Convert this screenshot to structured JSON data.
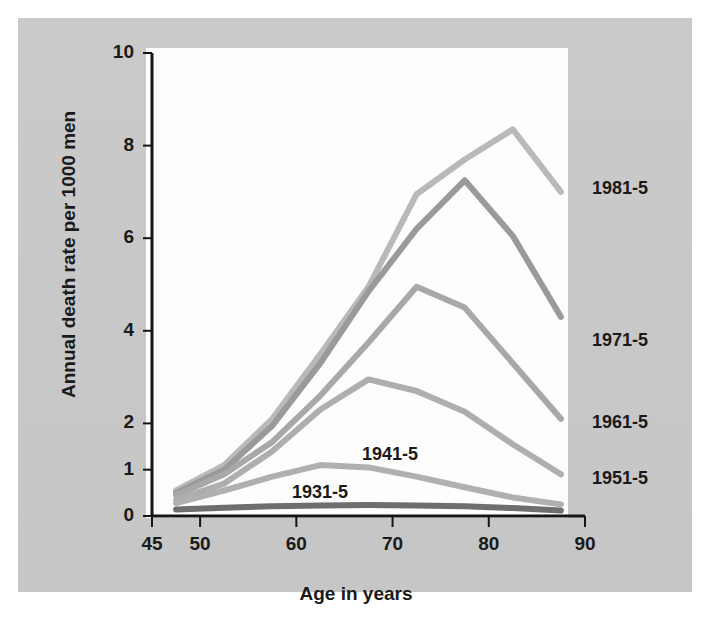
{
  "chart_data": {
    "type": "line",
    "title": "",
    "xlabel": "Age in years",
    "ylabel": "Annual death rate per 1000 men",
    "xlim": [
      45,
      90
    ],
    "ylim": [
      0,
      10
    ],
    "xticks": [
      45,
      50,
      60,
      70,
      80,
      90
    ],
    "xticklabels": [
      "45",
      "50",
      "60",
      "70",
      "80",
      "90"
    ],
    "yticks": [
      0,
      1,
      2,
      4,
      6,
      8,
      10
    ],
    "yticklabels": [
      "0",
      "1",
      "2",
      "4",
      "6",
      "8",
      "10"
    ],
    "grid": false,
    "legend_position": "inline-right",
    "x": [
      47.5,
      52.5,
      57.5,
      62.5,
      67.5,
      72.5,
      77.5,
      82.5,
      87.5
    ],
    "series": [
      {
        "name": "1981-5",
        "color": "#b9b9b9",
        "label_x": 592,
        "label_y": 178,
        "label_inline": false,
        "values": [
          0.55,
          1.1,
          2.1,
          3.5,
          4.95,
          6.95,
          7.7,
          8.35,
          7.0
        ]
      },
      {
        "name": "1971-5",
        "color": "#9a9a9a",
        "label_x": 592,
        "label_y": 330,
        "label_inline": false,
        "values": [
          0.5,
          1.0,
          1.95,
          3.3,
          4.85,
          6.2,
          7.25,
          6.05,
          4.3
        ]
      },
      {
        "name": "1961-5",
        "color": "#a8a8a8",
        "label_x": 592,
        "label_y": 412,
        "label_inline": false,
        "values": [
          0.45,
          0.9,
          1.6,
          2.6,
          3.75,
          4.95,
          4.5,
          3.3,
          2.1
        ]
      },
      {
        "name": "1951-5",
        "color": "#aeaeae",
        "label_x": 592,
        "label_y": 468,
        "label_inline": false,
        "values": [
          0.35,
          0.7,
          1.4,
          2.3,
          2.95,
          2.7,
          2.25,
          1.55,
          0.9
        ]
      },
      {
        "name": "1941-5",
        "color": "#b0b0b0",
        "label_x": 362,
        "label_y": 444,
        "label_inline": true,
        "values": [
          0.28,
          0.55,
          0.85,
          1.1,
          1.05,
          0.85,
          0.62,
          0.4,
          0.25
        ]
      },
      {
        "name": "1931-5",
        "color": "#6e6e6e",
        "label_x": 292,
        "label_y": 482,
        "label_inline": true,
        "values": [
          0.14,
          0.18,
          0.21,
          0.23,
          0.24,
          0.23,
          0.21,
          0.17,
          0.12
        ]
      }
    ]
  },
  "axes": {
    "x_title": "Age in years",
    "y_title": "Annual death rate per 1000 men"
  }
}
